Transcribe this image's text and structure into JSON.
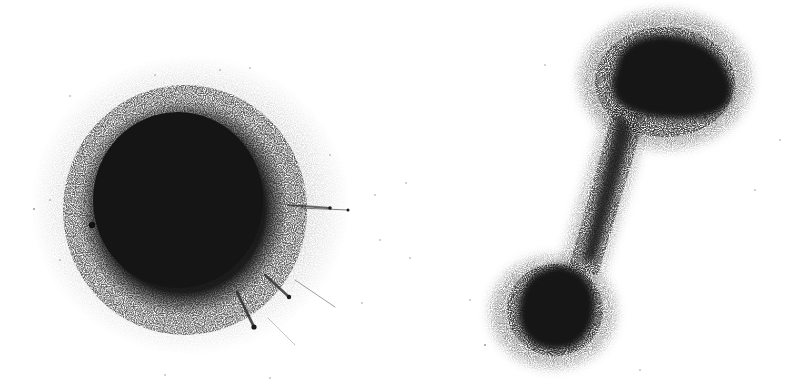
{
  "figure": {
    "background": "#ffffff",
    "ink_color": "#1a1a1a",
    "panels": [
      {
        "id": "left",
        "description": "single dense hairball network cluster",
        "shape": "blob",
        "center": [
          185,
          210
        ],
        "radius": [
          105,
          110
        ],
        "spikes": [
          {
            "from": [
              290,
              205
            ],
            "to": [
              348,
              210
            ]
          },
          {
            "from": [
              270,
              270
            ],
            "to": [
              289,
              297
            ]
          },
          {
            "from": [
              235,
              290
            ],
            "to": [
              254,
              327
            ]
          },
          {
            "from": [
              295,
              275
            ],
            "to": [
              335,
              305
            ]
          }
        ],
        "outlier_dot": [
          92,
          225
        ]
      },
      {
        "id": "right",
        "description": "dumbbell-shaped network with two dense clusters joined by a bridge",
        "shape": "dumbbell",
        "top_cluster": {
          "center": [
            665,
            80
          ],
          "radius": [
            68,
            52
          ]
        },
        "bottom_cluster": {
          "center": [
            555,
            310
          ],
          "radius": [
            45,
            45
          ]
        },
        "bridge": {
          "from": [
            625,
            120
          ],
          "to": [
            575,
            275
          ]
        }
      }
    ]
  }
}
